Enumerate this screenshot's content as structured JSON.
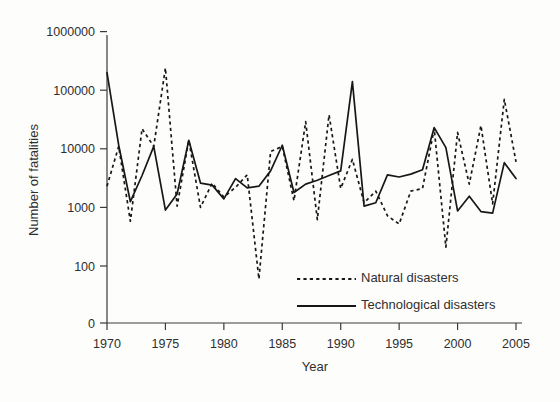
{
  "chart_data": {
    "type": "line",
    "title": "",
    "xlabel": "Year",
    "ylabel": "Number of fatalities",
    "yscale": "log",
    "ylim": [
      0,
      1000000
    ],
    "xlim": [
      1970,
      2005
    ],
    "grid": false,
    "legend_position": "lower-right-inside",
    "y_tick_labels": [
      "0",
      "100",
      "1000",
      "10000",
      "100000",
      "1000000"
    ],
    "y_tick_values": [
      0,
      100,
      1000,
      10000,
      100000,
      1000000
    ],
    "x_tick_labels": [
      "1970",
      "1975",
      "1980",
      "1985",
      "1990",
      "1995",
      "2000",
      "2005"
    ],
    "x_tick_values": [
      1970,
      1975,
      1980,
      1985,
      1990,
      1995,
      2000,
      2005
    ],
    "x": [
      1970,
      1971,
      1972,
      1973,
      1974,
      1975,
      1976,
      1977,
      1978,
      1979,
      1980,
      1981,
      1982,
      1983,
      1984,
      1985,
      1986,
      1987,
      1988,
      1989,
      1990,
      1991,
      1992,
      1993,
      1994,
      1995,
      1996,
      1997,
      1998,
      1999,
      2000,
      2001,
      2002,
      2003,
      2004,
      2005
    ],
    "series": [
      {
        "name": "Natural disasters",
        "style": "dashed",
        "color": "#171717",
        "values": [
          2300,
          11000,
          580,
          22000,
          11000,
          240000,
          1050,
          14000,
          1000,
          2600,
          1500,
          2200,
          3600,
          60,
          9000,
          11000,
          1300,
          29000,
          620,
          38000,
          2100,
          6600,
          1200,
          1900,
          720,
          520,
          1900,
          2100,
          22000,
          210,
          19000,
          2500,
          25000,
          1150,
          70000,
          6000
        ]
      },
      {
        "name": "Technological disasters",
        "style": "solid",
        "color": "#171717",
        "values": [
          200000,
          11500,
          1250,
          3500,
          11000,
          900,
          1700,
          14000,
          2600,
          2400,
          1400,
          3100,
          2150,
          2300,
          4200,
          11500,
          1800,
          2500,
          2900,
          3500,
          4200,
          140000,
          1050,
          1200,
          3600,
          3300,
          3700,
          4400,
          23000,
          10500,
          870,
          1550,
          850,
          800,
          5800,
          3100
        ]
      }
    ]
  },
  "legend": {
    "items": [
      {
        "label": "Natural disasters",
        "style": "dashed"
      },
      {
        "label": "Technological disasters",
        "style": "solid"
      }
    ]
  },
  "axes": {
    "x_title": "Year",
    "y_title": "Number of fatalities"
  }
}
